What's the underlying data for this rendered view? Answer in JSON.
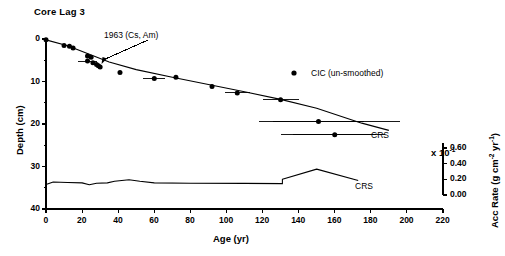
{
  "title": "Core Lag 3",
  "axes": {
    "x": {
      "label": "Age (yr)",
      "ticks": [
        0,
        20,
        40,
        60,
        80,
        100,
        120,
        140,
        160,
        180,
        200,
        220
      ],
      "range": [
        0,
        220
      ]
    },
    "y_left": {
      "label": "Depth (cm)",
      "ticks": [
        0,
        10,
        20,
        30,
        40
      ],
      "minor_ticks": [
        5,
        15,
        25,
        35
      ],
      "range": [
        0,
        40
      ]
    },
    "y_right": {
      "label": "Acc Rate (g cm-2 yr-1)",
      "label_display": "Acc Rate (g cm",
      "sup1": "-2",
      "mid": " yr",
      "sup2": "-1",
      "close": ")",
      "multiplier": "x 10",
      "multiplier_exp": "-1",
      "ticks": [
        "0.60",
        "0.40",
        "0.20",
        "0.00"
      ],
      "range": [
        0.0,
        0.6
      ]
    }
  },
  "legend": {
    "marker": "filled-circle",
    "label": "CIC (un-smoothed)"
  },
  "annotations": [
    {
      "name": "cs-am-marker",
      "text": "1963 (Cs, Am)",
      "age": 29,
      "depth": 6.1
    },
    {
      "name": "crs-depth-label",
      "text": "CRS"
    },
    {
      "name": "crs-accrate-label",
      "text": "CRS"
    }
  ],
  "chart_data": {
    "type": "scatter",
    "title": "Core Lag 3",
    "xlabel": "Age (yr)",
    "ylabel": "Depth (cm)",
    "ylabel_secondary": "Acc Rate (g cm-2 yr-1)",
    "xlim": [
      0,
      220
    ],
    "ylim": [
      40,
      0
    ],
    "ylim_secondary": [
      0.0,
      0.6
    ],
    "grid": false,
    "legend_position": "upper-right",
    "series": [
      {
        "name": "CIC (un-smoothed)",
        "type": "scatter",
        "marker": "filled-circle",
        "points": [
          {
            "age": 0,
            "depth": 0.2,
            "xerr": 0
          },
          {
            "age": 10,
            "depth": 1.5,
            "xerr": 0
          },
          {
            "age": 13,
            "depth": 1.7,
            "xerr": 0
          },
          {
            "age": 15,
            "depth": 2.1,
            "xerr": 0
          },
          {
            "age": 23,
            "depth": 4.0,
            "xerr": 0
          },
          {
            "age": 25,
            "depth": 4.3,
            "xerr": 0
          },
          {
            "age": 23,
            "depth": 5.2,
            "xerr": 5
          },
          {
            "age": 26,
            "depth": 5.6,
            "xerr": 0
          },
          {
            "age": 28,
            "depth": 6.0,
            "xerr": 0
          },
          {
            "age": 29,
            "depth": 6.3,
            "xerr": 0
          },
          {
            "age": 30,
            "depth": 6.6,
            "xerr": 0
          },
          {
            "age": 41,
            "depth": 7.9,
            "xerr": 0
          },
          {
            "age": 60,
            "depth": 9.3,
            "xerr": 6
          },
          {
            "age": 72,
            "depth": 9.0,
            "xerr": 0
          },
          {
            "age": 92,
            "depth": 11.2,
            "xerr": 0
          },
          {
            "age": 106,
            "depth": 12.7,
            "xerr": 7
          },
          {
            "age": 130,
            "depth": 14.3,
            "xerr": 10
          },
          {
            "age": 151,
            "depth": 19.4,
            "xerr": 25
          },
          {
            "age": 160,
            "depth": 22.5,
            "xerr": 23
          }
        ]
      },
      {
        "name": "CRS depth model",
        "type": "line",
        "points": [
          {
            "age": 0,
            "depth": 0.2
          },
          {
            "age": 12,
            "depth": 1.6
          },
          {
            "age": 24,
            "depth": 3.6
          },
          {
            "age": 35,
            "depth": 5.4
          },
          {
            "age": 50,
            "depth": 7.2
          },
          {
            "age": 70,
            "depth": 9.0
          },
          {
            "age": 90,
            "depth": 10.7
          },
          {
            "age": 110,
            "depth": 12.4
          },
          {
            "age": 130,
            "depth": 14.2
          },
          {
            "age": 150,
            "depth": 16.3
          },
          {
            "age": 175,
            "depth": 19.8
          },
          {
            "age": 190,
            "depth": 21.5
          }
        ]
      },
      {
        "name": "CRS accumulation rate",
        "type": "line",
        "unit": "g cm-2 yr-1 (x10-1)",
        "points": [
          {
            "age": 0,
            "rate": 0.135
          },
          {
            "age": 4,
            "rate": 0.165
          },
          {
            "age": 12,
            "rate": 0.16
          },
          {
            "age": 20,
            "rate": 0.155
          },
          {
            "age": 24,
            "rate": 0.13
          },
          {
            "age": 28,
            "rate": 0.15
          },
          {
            "age": 34,
            "rate": 0.155
          },
          {
            "age": 38,
            "rate": 0.175
          },
          {
            "age": 46,
            "rate": 0.195
          },
          {
            "age": 52,
            "rate": 0.175
          },
          {
            "age": 60,
            "rate": 0.155
          },
          {
            "age": 80,
            "rate": 0.15
          },
          {
            "age": 110,
            "rate": 0.148
          },
          {
            "age": 131,
            "rate": 0.145
          },
          {
            "age": 131,
            "rate": 0.2
          },
          {
            "age": 150,
            "rate": 0.33
          },
          {
            "age": 173,
            "rate": 0.185
          }
        ]
      }
    ]
  }
}
